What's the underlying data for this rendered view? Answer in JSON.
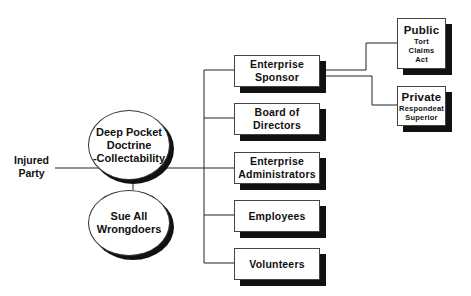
{
  "diagram": {
    "source_label": {
      "line1": "Injured",
      "line2": "Party"
    },
    "strategies": [
      {
        "line1": "Deep Pocket",
        "line2": "Doctrine",
        "line3": "-Collectability"
      },
      {
        "line1": "Sue All",
        "line2": "Wrongdoers"
      }
    ],
    "defendants": [
      {
        "line1": "Enterprise",
        "line2": "Sponsor"
      },
      {
        "line1": "Board of",
        "line2": "Directors"
      },
      {
        "line1": "Enterprise",
        "line2": "Administrators"
      },
      {
        "line1": "Employees"
      },
      {
        "line1": "Volunteers"
      }
    ],
    "sponsor_types": [
      {
        "title": "Public",
        "sub1": "Tort",
        "sub2": "Claims",
        "sub3": "Act"
      },
      {
        "title": "Private",
        "sub1": "Respondeat",
        "sub2": "Superior"
      }
    ]
  }
}
